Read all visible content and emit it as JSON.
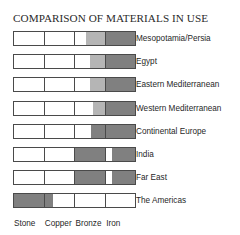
{
  "chart_data": {
    "type": "bar",
    "title": "COMPARISON OF MATERIALS IN USE",
    "xlabel": "",
    "ylabel": "",
    "grid": false,
    "legend": "none",
    "orientation": "horizontal",
    "note": "Stacked horizontal band chart: each row is a region, divided into four equal material-era columns (Stone, Copper, Bronze, Iron). Shaded (gray) fraction of each column indicates the material in use for that region.",
    "categories": [
      "Stone",
      "Copper",
      "Bronze",
      "Iron"
    ],
    "column_count": 4,
    "rows": [
      {
        "label": "Mesopotamia/Persia",
        "fills": [
          0,
          0,
          0.62,
          1.0
        ],
        "fill_shades": [
          "none",
          "none",
          "light",
          "dark"
        ]
      },
      {
        "label": "Egypt",
        "fills": [
          0,
          0,
          0.5,
          1.0
        ],
        "fill_shades": [
          "none",
          "none",
          "light",
          "dark"
        ]
      },
      {
        "label": "Eastern Mediterranean",
        "fills": [
          0,
          0,
          0.5,
          1.0
        ],
        "fill_shades": [
          "none",
          "none",
          "light",
          "dark"
        ]
      },
      {
        "label": "Western Mediterranean",
        "fills": [
          0,
          0,
          0.38,
          1.0
        ],
        "fill_shades": [
          "none",
          "none",
          "light",
          "dark"
        ]
      },
      {
        "label": "Continental Europe",
        "fills": [
          0,
          0,
          0.45,
          1.0
        ],
        "fill_shades": [
          "none",
          "none",
          "dark",
          "dark"
        ]
      },
      {
        "label": "India",
        "fills": [
          0,
          0,
          1.0,
          0.78
        ],
        "fill_shades": [
          "none",
          "none",
          "dark",
          "dark"
        ]
      },
      {
        "label": "Far East",
        "fills": [
          0,
          0,
          1.0,
          0.78
        ],
        "fill_shades": [
          "none",
          "none",
          "dark",
          "dark"
        ]
      },
      {
        "label": "The Americas",
        "fills": [
          1.0,
          0.3,
          0,
          0
        ],
        "fill_shades": [
          "dark",
          "dark",
          "none",
          "none"
        ]
      }
    ],
    "xtick_labels": [
      "Stone",
      "Copper",
      "Bronze",
      "Iron"
    ],
    "colors": {
      "fill_dark": "#808080",
      "fill_light": "#b5b5b5",
      "border": "#4a4a4a",
      "background": "#ffffff",
      "text": "#1f1f1f"
    }
  }
}
